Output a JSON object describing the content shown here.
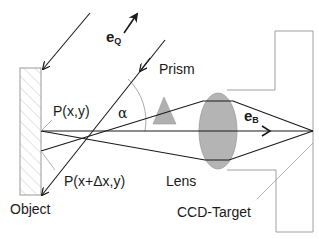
{
  "diagram": {
    "type": "optical-setup",
    "labels": {
      "object": "Object",
      "prism": "Prism",
      "lens": "Lens",
      "ccd_target": "CCD-Target",
      "point_a": "P(x,y)",
      "point_b": "P(x+Δx,y)",
      "angle": "α",
      "illumination_vector": "e",
      "illumination_vector_sub": "Q",
      "observation_vector": "e",
      "observation_vector_sub": "B"
    },
    "colors": {
      "line": "#1a1a1a",
      "outline": "#9a9a9a",
      "lens_fill": "#b4b4b4",
      "prism_fill": "#b0b0b0",
      "hatch": "#c8c8c8",
      "background": "#ffffff"
    }
  }
}
